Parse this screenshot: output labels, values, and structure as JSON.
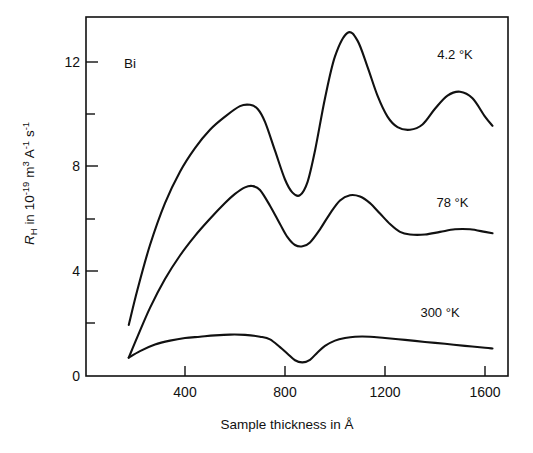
{
  "chart_data": {
    "type": "line",
    "title": "",
    "annotation_material": "Bi",
    "xlabel": "Sample thickness in Å",
    "ylabel": "R_H in 10^-19 m^3 A^-1 s^-1",
    "ylabel_parts": {
      "symbol": "R",
      "symbol_sub": "H",
      "text_in": " in 10",
      "exp1": "-19",
      "unit_m": " m",
      "exp_m": "3",
      "unit_a": " A",
      "exp_a": "-1",
      "unit_s": " s",
      "exp_s": "-1"
    },
    "xlim": [
      170,
      1650
    ],
    "ylim": [
      0,
      13.8
    ],
    "xticks": [
      400,
      800,
      1200,
      1600
    ],
    "xtick_labels": [
      "400",
      "800",
      "1200",
      "1600"
    ],
    "yticks": [
      0,
      4,
      8,
      12
    ],
    "ytick_labels": [
      "0",
      "4",
      "8",
      "12"
    ],
    "y_minor_ticks": [
      2,
      6,
      10
    ],
    "grid": false,
    "legend_position": "inline-right",
    "line_color": "#111111",
    "series": [
      {
        "name": "4.2 °K",
        "label": "4.2 °K",
        "label_x": 1480,
        "label_y": 12.1,
        "x": [
          175,
          210,
          260,
          320,
          380,
          440,
          500,
          560,
          620,
          660,
          690,
          720,
          760,
          800,
          830,
          860,
          890,
          920,
          960,
          1000,
          1050,
          1090,
          1130,
          1170,
          1210,
          1250,
          1300,
          1350,
          1400,
          1450,
          1500,
          1550,
          1600,
          1630
        ],
        "y": [
          1.95,
          3.3,
          5.0,
          6.6,
          7.8,
          8.7,
          9.4,
          9.9,
          10.3,
          10.35,
          10.2,
          9.7,
          8.6,
          7.5,
          7.0,
          6.9,
          7.4,
          8.6,
          10.6,
          12.2,
          13.1,
          12.8,
          11.8,
          10.7,
          9.9,
          9.5,
          9.4,
          9.6,
          10.2,
          10.7,
          10.85,
          10.6,
          9.9,
          9.55
        ]
      },
      {
        "name": "78 °K",
        "label": "78 °K",
        "label_x": 1470,
        "label_y": 6.45,
        "x": [
          175,
          210,
          260,
          320,
          380,
          440,
          500,
          560,
          600,
          640,
          670,
          700,
          740,
          780,
          810,
          840,
          870,
          900,
          940,
          980,
          1020,
          1060,
          1100,
          1140,
          1180,
          1220,
          1260,
          1300,
          1360,
          1420,
          1480,
          1540,
          1600,
          1630
        ],
        "y": [
          0.7,
          1.5,
          2.6,
          3.7,
          4.6,
          5.35,
          6.0,
          6.6,
          6.95,
          7.2,
          7.25,
          7.1,
          6.5,
          5.8,
          5.3,
          5.0,
          4.95,
          5.1,
          5.6,
          6.2,
          6.7,
          6.9,
          6.85,
          6.6,
          6.2,
          5.8,
          5.5,
          5.4,
          5.4,
          5.5,
          5.6,
          5.6,
          5.5,
          5.45
        ]
      },
      {
        "name": "300 °K",
        "label": "300 °K",
        "label_x": 1420,
        "label_y": 2.25,
        "x": [
          175,
          220,
          280,
          340,
          400,
          460,
          520,
          580,
          640,
          700,
          740,
          780,
          810,
          840,
          870,
          900,
          930,
          960,
          1000,
          1040,
          1080,
          1140,
          1200,
          1280,
          1360,
          1440,
          1520,
          1600,
          1630
        ],
        "y": [
          0.7,
          0.95,
          1.2,
          1.35,
          1.45,
          1.5,
          1.55,
          1.58,
          1.57,
          1.5,
          1.4,
          1.1,
          0.85,
          0.6,
          0.52,
          0.62,
          0.9,
          1.15,
          1.35,
          1.45,
          1.5,
          1.5,
          1.45,
          1.38,
          1.3,
          1.23,
          1.15,
          1.08,
          1.05
        ]
      }
    ]
  },
  "figure": {
    "material_label": "Bi",
    "xaxis_title": "Sample thickness in Å",
    "xtick_labels": [
      "400",
      "800",
      "1200",
      "1600"
    ],
    "ytick_labels": [
      "0",
      "4",
      "8",
      "12"
    ],
    "series_labels": [
      "4.2 °K",
      "78 °K",
      "300 °K"
    ]
  }
}
